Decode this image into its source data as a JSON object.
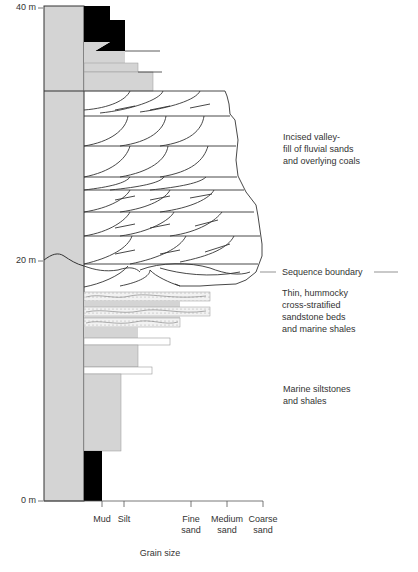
{
  "depth_labels": [
    {
      "text": "40 m",
      "y": 6
    },
    {
      "text": "20 m",
      "y": 261
    },
    {
      "text": "0 m",
      "y": 501
    }
  ],
  "grain_size_axis": {
    "title": "Grain size",
    "ticks": [
      {
        "label": "Mud",
        "x": 102
      },
      {
        "label": "Silt",
        "x": 124
      },
      {
        "label": "Fine\nsand",
        "x": 191
      },
      {
        "label": "Medium\nsand",
        "x": 227
      },
      {
        "label": "Coarse\nsand",
        "x": 263
      }
    ]
  },
  "annotations": [
    {
      "id": "incised-valley",
      "text": "Incised valley-\nfill of  fluvial sands\nand overlying coals",
      "x": 283,
      "y": 131
    },
    {
      "id": "sequence-boundary",
      "text": "Sequence boundary",
      "x": 282,
      "y": 266
    },
    {
      "id": "hummocky",
      "text": "Thin, hummocky\ncross-stratified\nsandstone beds\nand marine shales",
      "x": 282,
      "y": 287
    },
    {
      "id": "marine-siltstones",
      "text": "Marine siltstones\nand shales",
      "x": 283,
      "y": 383
    }
  ],
  "colors": {
    "gray_fill": "#d4d4d4",
    "coal": "#000000",
    "line": "#333333",
    "sand_dots": "#999999"
  }
}
